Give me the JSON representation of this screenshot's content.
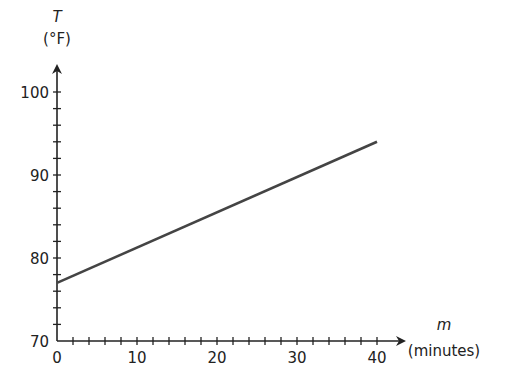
{
  "chart_data": {
    "type": "line",
    "title": "",
    "xlabel": "m",
    "xlabel_unit": "(minutes)",
    "ylabel": "T",
    "ylabel_unit": "(°F)",
    "xlim": [
      0,
      40
    ],
    "ylim": [
      70,
      100
    ],
    "x_ticks": [
      0,
      10,
      20,
      30,
      40
    ],
    "y_ticks": [
      70,
      80,
      90,
      100
    ],
    "x_minor_step": 2,
    "y_minor_step": 2,
    "grid": false,
    "legend": null,
    "series": [
      {
        "name": "T",
        "x": [
          0,
          40
        ],
        "values": [
          77,
          94
        ],
        "color": "#444444"
      }
    ]
  },
  "axes": {
    "x_label": "m",
    "x_unit": "(minutes)",
    "y_label": "T",
    "y_unit": "(°F)"
  }
}
